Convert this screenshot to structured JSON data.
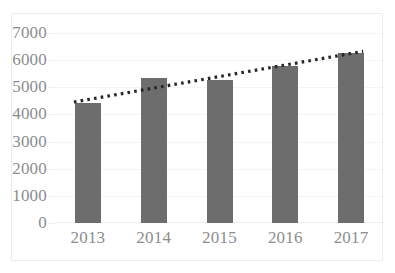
{
  "caption_fragment": "· · ·",
  "chart_data": {
    "type": "bar",
    "title": "",
    "subtitle": "",
    "xlabel": "",
    "ylabel": "",
    "categories": [
      "2013",
      "2014",
      "2015",
      "2016",
      "2017"
    ],
    "values": [
      4430,
      5350,
      5280,
      5800,
      6280
    ],
    "series": [
      {
        "name": "Value",
        "values": [
          4430,
          5350,
          5280,
          5800,
          6280
        ],
        "color": "#6d6d6d",
        "type": "bar"
      },
      {
        "name": "Trendline",
        "values": [
          4530,
          5100,
          5530,
          5840,
          6250
        ],
        "color": "#262626",
        "type": "line",
        "style": "dotted"
      }
    ],
    "ylim": [
      0,
      7000
    ],
    "ytick_labels": [
      "0",
      "1000",
      "2000",
      "3000",
      "4000",
      "5000",
      "6000",
      "7000"
    ],
    "ytick_values": [
      0,
      1000,
      2000,
      3000,
      4000,
      5000,
      6000,
      7000
    ],
    "xtick_labels": [
      "2013",
      "2014",
      "2015",
      "2016",
      "2017"
    ],
    "grid": true,
    "grid_axis": "y",
    "legend": false,
    "legend_position": "none",
    "annotations": [],
    "colors": {
      "bar": "#6d6d6d",
      "trendline": "#262626",
      "gridline": "#f4f4f5",
      "axis_text": "#8d8d8f",
      "frame": "#ececed",
      "background": "#ffffff"
    }
  }
}
